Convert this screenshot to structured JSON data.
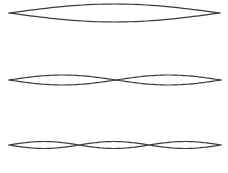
{
  "diagram": {
    "stroke_color": "#3a3a3a",
    "background": "#ffffff",
    "modes": [
      {
        "harmonic": 1,
        "center_y": 13,
        "x_start": 9,
        "x_end": 220,
        "amplitude": 9,
        "nodes_x": [
          9,
          220
        ]
      },
      {
        "harmonic": 2,
        "center_y": 80,
        "x_start": 9,
        "x_end": 221,
        "amplitude": 5,
        "nodes_x": [
          9,
          116,
          221
        ]
      },
      {
        "harmonic": 3,
        "center_y": 145,
        "x_start": 9,
        "x_end": 221,
        "amplitude": 3.5,
        "nodes_x": [
          9,
          79,
          149,
          221
        ]
      }
    ]
  }
}
